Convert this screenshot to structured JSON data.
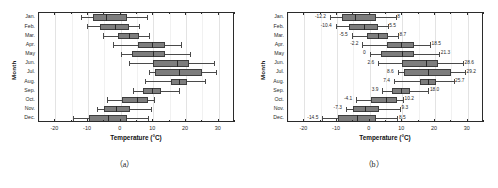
{
  "figure": {
    "panels": [
      {
        "key": "a",
        "caption": "（a）"
      },
      {
        "key": "b",
        "caption": "（b）"
      }
    ]
  },
  "axis": {
    "xlabel": "Temperature (°C)",
    "ylabel": "Month",
    "xticks": [
      "-20",
      "-10",
      "0",
      "10",
      "20",
      "30"
    ],
    "xtick_values": [
      -20,
      -10,
      0,
      10,
      20,
      30
    ],
    "xlim": [
      -25,
      35
    ],
    "categories": [
      "Jan.",
      "Feb.",
      "Mar.",
      "Apr.",
      "May",
      "Jun.",
      "Jul.",
      "Aug.",
      "Sep.",
      "Oct.",
      "Nov.",
      "Dec."
    ]
  },
  "chart_data": {
    "type": "box",
    "orientation": "horizontal",
    "title": "",
    "xlabel": "Temperature (°C)",
    "ylabel": "Month",
    "xlim": [
      -25,
      35
    ],
    "ylim": [
      0,
      13
    ],
    "grid": "vertical-light",
    "legend": "none",
    "categories": [
      "Jan.",
      "Feb.",
      "Mar.",
      "Apr.",
      "May",
      "Jun.",
      "Jul.",
      "Aug.",
      "Sep.",
      "Oct.",
      "Nov.",
      "Dec."
    ],
    "panel_a": {
      "caption": "（a）",
      "annotations": false,
      "boxes": [
        {
          "category": "Jan.",
          "min": -12.2,
          "q1": -8.6,
          "median": -4.5,
          "q3": 1.8,
          "max": 8.0
        },
        {
          "category": "Feb.",
          "min": -10.4,
          "q1": -6.2,
          "median": -1.8,
          "q3": 2.6,
          "max": 5.5
        },
        {
          "category": "Mar.",
          "min": -5.5,
          "q1": -0.8,
          "median": 2.6,
          "q3": 5.6,
          "max": 8.7
        },
        {
          "category": "Apr.",
          "min": -2.2,
          "q1": 5.4,
          "median": 9.6,
          "q3": 13.7,
          "max": 18.5
        },
        {
          "category": "May",
          "min": 0.0,
          "q1": 3.4,
          "median": 9.8,
          "q3": 13.6,
          "max": 21.3
        },
        {
          "category": "Jun.",
          "min": 2.6,
          "q1": 10.0,
          "median": 17.2,
          "q3": 21.0,
          "max": 28.6
        },
        {
          "category": "Jul.",
          "min": 8.6,
          "q1": 10.5,
          "median": 18.0,
          "q3": 25.0,
          "max": 29.2
        },
        {
          "category": "Aug.",
          "min": 7.4,
          "q1": 15.4,
          "median": 17.8,
          "q3": 20.2,
          "max": 25.7
        },
        {
          "category": "Sep.",
          "min": 3.9,
          "q1": 6.8,
          "median": 9.5,
          "q3": 12.4,
          "max": 18.0
        },
        {
          "category": "Oct.",
          "min": -4.1,
          "q1": 0.4,
          "median": 5.0,
          "q3": 8.4,
          "max": 10.2
        },
        {
          "category": "Nov.",
          "min": -7.3,
          "q1": -5.0,
          "median": -1.4,
          "q3": 2.9,
          "max": 9.3
        },
        {
          "category": "Dec.",
          "min": -14.5,
          "q1": -9.6,
          "median": -3.8,
          "q3": 1.9,
          "max": 8.5
        }
      ]
    },
    "panel_b": {
      "caption": "（b）",
      "annotations": true,
      "boxes": [
        {
          "category": "Jan.",
          "min": -12.2,
          "q1": -8.6,
          "median": -4.5,
          "q3": 1.8,
          "max": 8.0,
          "min_label": "-12.2",
          "max_label": "8"
        },
        {
          "category": "Feb.",
          "min": -10.4,
          "q1": -6.2,
          "median": -1.8,
          "q3": 2.6,
          "max": 5.5,
          "min_label": "-10.4",
          "max_label": "5.5"
        },
        {
          "category": "Mar.",
          "min": -5.5,
          "q1": -0.8,
          "median": 2.6,
          "q3": 5.6,
          "max": 8.7,
          "min_label": "-5.5",
          "max_label": "8.7"
        },
        {
          "category": "Apr.",
          "min": -2.2,
          "q1": 5.4,
          "median": 9.6,
          "q3": 13.7,
          "max": 18.5,
          "min_label": "-2.2",
          "max_label": "18.5"
        },
        {
          "category": "May",
          "min": 0.0,
          "q1": 3.4,
          "median": 9.8,
          "q3": 13.6,
          "max": 21.3,
          "min_label": "0",
          "max_label": "21.3"
        },
        {
          "category": "Jun.",
          "min": 2.6,
          "q1": 10.0,
          "median": 17.2,
          "q3": 21.0,
          "max": 28.6,
          "min_label": "2.6",
          "max_label": "28.6"
        },
        {
          "category": "Jul.",
          "min": 8.6,
          "q1": 10.5,
          "median": 18.0,
          "q3": 25.0,
          "max": 29.2,
          "min_label": "8.6",
          "max_label": "29.2"
        },
        {
          "category": "Aug.",
          "min": 7.4,
          "q1": 15.4,
          "median": 17.8,
          "q3": 20.2,
          "max": 25.7,
          "min_label": "7.4",
          "max_label": "25.7"
        },
        {
          "category": "Sep.",
          "min": 3.9,
          "q1": 6.8,
          "median": 9.5,
          "q3": 12.4,
          "max": 18.0,
          "min_label": "3.9",
          "max_label": "18.0"
        },
        {
          "category": "Oct.",
          "min": -4.1,
          "q1": 0.4,
          "median": 5.0,
          "q3": 8.4,
          "max": 10.2,
          "min_label": "-4.1",
          "max_label": "10.2"
        },
        {
          "category": "Nov.",
          "min": -7.3,
          "q1": -5.0,
          "median": -1.4,
          "q3": 2.9,
          "max": 9.3,
          "min_label": "-7.3",
          "max_label": "9.3"
        },
        {
          "category": "Dec.",
          "min": -14.5,
          "q1": -9.6,
          "median": -3.8,
          "q3": 1.9,
          "max": 8.5,
          "min_label": "-14.5",
          "max_label": "8.5"
        }
      ]
    }
  }
}
